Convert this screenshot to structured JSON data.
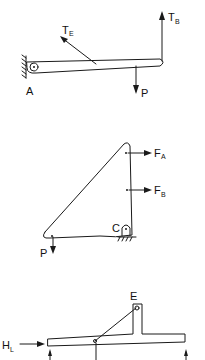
{
  "figure_1": {
    "description": "Cantilever beam pinned at A with cable tension TE, end tension TB and load P",
    "labels": {
      "support": "A",
      "tension_e_main": "T",
      "tension_e_sub": "E",
      "tension_b_main": "T",
      "tension_b_sub": "B",
      "load": "P"
    }
  },
  "figure_2": {
    "description": "Triangular plate supported by pin C with horizontal forces FA, FB and downward load P",
    "labels": {
      "force_a_main": "F",
      "force_a_sub": "A",
      "force_b_main": "F",
      "force_b_sub": "B",
      "support": "C",
      "load": "P"
    }
  },
  "figure_3": {
    "description": "T-shaped bar with cable from E, horizontal force HL and vertical reactions",
    "labels": {
      "point": "E",
      "force_main": "H",
      "force_sub": "L"
    }
  },
  "colors": {
    "ink": "#1a1a1a",
    "background": "#ffffff"
  }
}
